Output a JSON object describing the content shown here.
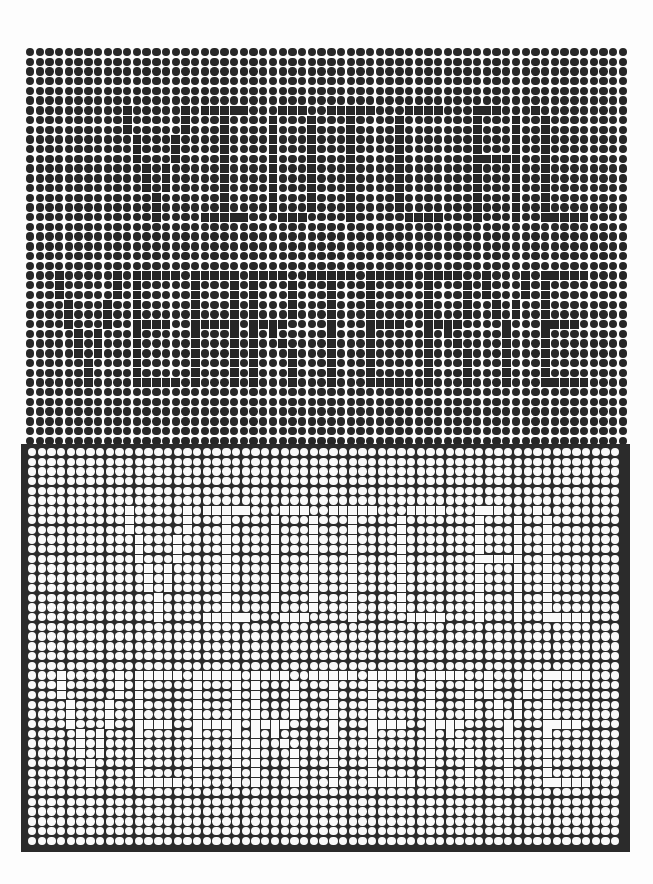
{
  "artwork": {
    "title": "Op-art dot grid with hidden square-letter pattern",
    "colors": {
      "background": "#fdfdfd",
      "dark": "#262626",
      "panel": "#2b2b2b",
      "light": "#fafafa"
    },
    "pitch": 9.72,
    "upper": {
      "origin": [
        30,
        52
      ],
      "cols": 62,
      "rows": 41,
      "mask": [
        "",
        "",
        "",
        "",
        "",
        "",
        "..........#.....#.#####...###..#####...####...###...#",
        "..........#.....#...#....#...#...#....#.......#...#..#",
        "..........#.....#...#....#...#...#....#.......#...#..#",
        "...........#...#....#....#...#...#....#.......#...#..#",
        "...........#...#....#....#...#...#....#.......#...#..#",
        "...........#...#....#....#...#...#....#.......#####..#",
        "............#.#.....#....#...#...#....#.......#...#..#",
        "............#.#.....#....#...#...#....#.......#...#..#",
        "............#.#.....#....#...#...#....#.......#...#..#",
        ".............#......#....#...#...#....#.......#...#..#",
        ".............#......#....#...#...#....#.......#...#..#",
        ".............#....#####...###....#.....####...#...#..#####",
        "",
        "",
        "",
        "",
        "",
        "...#.....#.#####.#####.####..#####.#####.####..#...#.#####",
        "...#.....#.#.....#...#.#...#...#...#.....#...#.#...#.#",
        "...#.....#.#.....#...#.#...#...#...#.....#...#.#...#.#",
        "....#...#..#.....#...#.#...#...#...#.....#...#..#.#..#",
        "....#...#..#.....#...#.#...#...#...#.....#...#..#.#..#",
        "....#...#..####..#####.####....#...####..####....#...####",
        ".....#.#...#.....#...#.#.#.....#...#.....#.#.....#...#",
        ".....#.#...#.....#...#.#..#....#...#.....#..#....#...#",
        ".....#.#...#.....#...#.#...#...#...#.....#...#...#...#",
        "......#....#.....#...#.#...#...#...#.....#...#...#...#",
        "......#....#.....#...#.#...#...#...#.....#...#...#...#",
        "......#....#####.#...#.#...#...#...#####.#...#...#...#####",
        "",
        "",
        "",
        "",
        ""
      ]
    },
    "lower": {
      "origin": [
        32,
        452
      ],
      "cols": 61,
      "rows": 41,
      "mask_source": "upper"
    }
  }
}
